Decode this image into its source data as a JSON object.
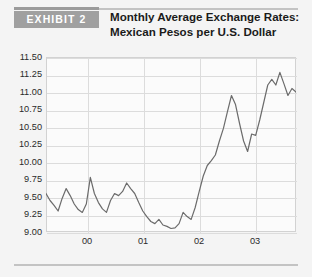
{
  "exhibit": {
    "badge_label": "EXHIBIT 2",
    "title_line1": "Monthly Average Exchange Rates:",
    "title_line2": "Mexican Pesos per U.S. Dollar"
  },
  "colors": {
    "badge_background": "#a0a0a0",
    "badge_text": "#ffffff",
    "page_background": "#f4f4f4",
    "plot_background": "#fbfbfb",
    "gridline": "#dcdcdc",
    "series_line": "#6b6b6b",
    "rule": "#c3c3c3",
    "rule_dark": "#9b9b9b"
  },
  "chart_data": {
    "type": "line",
    "title": "Monthly Average Exchange Rates: Mexican Pesos per U.S. Dollar",
    "xlabel": "",
    "ylabel": "",
    "ylim": [
      9.0,
      11.5
    ],
    "ytick_labels": [
      "11.50",
      "11.25",
      "11.00",
      "10.75",
      "10.50",
      "10.25",
      "10.00",
      "9.75",
      "9.50",
      "9.25",
      "9.00"
    ],
    "ytick_values": [
      11.5,
      11.25,
      11.0,
      10.75,
      10.5,
      10.25,
      10.0,
      9.75,
      9.5,
      9.25,
      9.0
    ],
    "xtick_labels": [
      "00",
      "01",
      "02",
      "03"
    ],
    "xtick_positions": [
      0.1632,
      0.3878,
      0.6122,
      0.8367
    ],
    "grid": true,
    "legend": "none",
    "series": [
      {
        "name": "Mexican Pesos per U.S. Dollar",
        "values": [
          9.55,
          9.45,
          9.38,
          9.3,
          9.48,
          9.62,
          9.52,
          9.4,
          9.32,
          9.28,
          9.4,
          9.78,
          9.55,
          9.42,
          9.33,
          9.28,
          9.45,
          9.55,
          9.52,
          9.58,
          9.7,
          9.62,
          9.55,
          9.42,
          9.3,
          9.22,
          9.15,
          9.12,
          9.18,
          9.1,
          9.08,
          9.05,
          9.06,
          9.12,
          9.28,
          9.22,
          9.18,
          9.35,
          9.58,
          9.8,
          9.95,
          10.02,
          10.1,
          10.3,
          10.48,
          10.72,
          10.95,
          10.82,
          10.55,
          10.3,
          10.15,
          10.4,
          10.38,
          10.6,
          10.85,
          11.1,
          11.18,
          11.1,
          11.28,
          11.12,
          10.95,
          11.05,
          11.0
        ]
      }
    ]
  }
}
